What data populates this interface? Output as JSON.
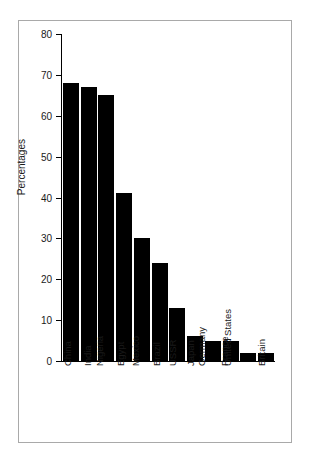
{
  "chart_data": {
    "type": "bar",
    "title": "",
    "xlabel": "",
    "ylabel": "Percentages",
    "ylim": [
      0,
      80
    ],
    "yticks": [
      0,
      10,
      20,
      30,
      40,
      50,
      60,
      70,
      80
    ],
    "grid": false,
    "legend": null,
    "orientation": "vertical",
    "bar_color": "#000000",
    "categories": [
      "China",
      "India",
      "Nigeria",
      "Egypt",
      "Mexico",
      "Brazil",
      "USSR",
      "Japan",
      "Germany",
      "France",
      "United States",
      "Britain"
    ],
    "values": [
      68,
      67,
      65,
      41,
      30,
      24,
      13,
      6,
      5,
      5,
      2,
      2
    ]
  },
  "axis": {
    "y_title": "Percentages",
    "tick_labels": [
      "80",
      "70",
      "60",
      "50",
      "40",
      "30",
      "20",
      "10",
      "0"
    ]
  },
  "frame": {
    "border_color": "#a9a9a9",
    "background": "#ffffff"
  }
}
